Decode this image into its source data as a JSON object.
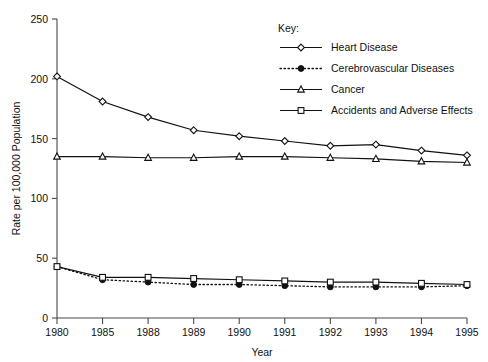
{
  "chart_data": {
    "type": "line",
    "title": "",
    "xlabel": "Year",
    "ylabel": "Rate per 100,000 Population",
    "categories": [
      "1980",
      "1985",
      "1988",
      "1989",
      "1990",
      "1991",
      "1992",
      "1993",
      "1994",
      "1995"
    ],
    "ylim": [
      0,
      250
    ],
    "yticks": [
      0,
      50,
      100,
      150,
      200,
      250
    ],
    "grid": false,
    "legend_position": "top-right",
    "legend_title": "Key:",
    "series": [
      {
        "name": "Heart Disease",
        "marker": "open-diamond",
        "linestyle": "solid",
        "values": [
          202,
          181,
          168,
          157,
          152,
          148,
          144,
          145,
          140,
          136
        ]
      },
      {
        "name": "Cerebrovascular Diseases",
        "marker": "filled-circle",
        "linestyle": "dotted",
        "values": [
          43,
          32,
          30,
          28,
          28,
          27,
          26,
          26,
          26,
          27
        ]
      },
      {
        "name": "Cancer",
        "marker": "open-triangle",
        "linestyle": "solid",
        "values": [
          135,
          135,
          134,
          134,
          135,
          135,
          134,
          133,
          131,
          130
        ]
      },
      {
        "name": "Accidents and Adverse Effects",
        "marker": "open-square",
        "linestyle": "solid",
        "values": [
          43,
          34,
          34,
          33,
          32,
          31,
          30,
          30,
          29,
          28
        ]
      }
    ]
  },
  "axes": {
    "y_tick_labels": [
      "0",
      "50",
      "100",
      "150",
      "200",
      "250"
    ],
    "x_tick_labels": [
      "1980",
      "1985",
      "1988",
      "1989",
      "1990",
      "1991",
      "1992",
      "1993",
      "1994",
      "1995"
    ],
    "y_axis_title": "Rate per 100,000 Population",
    "x_axis_title": "Year"
  },
  "legend": {
    "title": "Key:",
    "items": [
      {
        "label": "Heart Disease",
        "marker": "open-diamond",
        "linestyle": "solid"
      },
      {
        "label": "Cerebrovascular Diseases",
        "marker": "filled-circle",
        "linestyle": "dotted"
      },
      {
        "label": "Cancer",
        "marker": "open-triangle",
        "linestyle": "solid"
      },
      {
        "label": "Accidents and Adverse Effects",
        "marker": "open-square",
        "linestyle": "solid"
      }
    ]
  },
  "colors": {
    "ink": "#111111",
    "axis": "#4a4a4a",
    "background": "#ffffff"
  }
}
